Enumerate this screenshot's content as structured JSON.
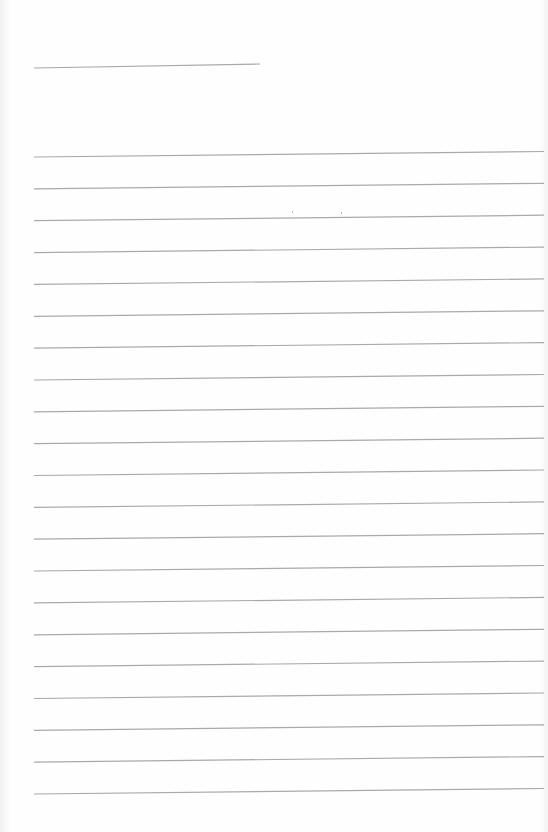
{
  "document": {
    "type": "lined-paper",
    "background_color": "#fefefe",
    "line_color": "#a9a9a9",
    "header_line": {
      "x1": 34,
      "y1": 68,
      "x2": 260,
      "y2": 64
    },
    "ruled_lines": {
      "count": 21,
      "x_start": 34,
      "x_end": 544,
      "first_y_left": 157,
      "spacing": 31.85,
      "rise_left_to_right": 5.5
    }
  }
}
